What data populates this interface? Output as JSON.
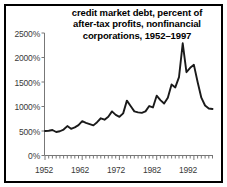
{
  "chart_data": {
    "type": "line",
    "title": "credit market debt, percent of after-tax profits, nonfinancial corporations, 1952–1997",
    "title_lines": [
      "credit market debt, percent of",
      "after-tax profits, nonfinancial",
      "corporations, 1952–1997"
    ],
    "xlabel": "",
    "ylabel": "",
    "xlim": [
      1952,
      1997
    ],
    "ylim": [
      0,
      2500
    ],
    "grid": false,
    "legend": null,
    "line_color": "#1a1a1a",
    "background_color": "#ffffff",
    "axis_color": "#555555",
    "border_color": "#000000",
    "ytick_labels": [
      "0%",
      "500%",
      "1000%",
      "1500%",
      "2000%",
      "2500%"
    ],
    "ytick_values": [
      0,
      500,
      1000,
      1500,
      2000,
      2500
    ],
    "xtick_labels": [
      "1952",
      "1962",
      "1972",
      "1982",
      "1992"
    ],
    "xtick_values": [
      1952,
      1962,
      1972,
      1982,
      1992
    ],
    "x": [
      1952,
      1953,
      1954,
      1955,
      1956,
      1957,
      1958,
      1959,
      1960,
      1961,
      1962,
      1963,
      1964,
      1965,
      1966,
      1967,
      1968,
      1969,
      1970,
      1971,
      1972,
      1973,
      1974,
      1975,
      1976,
      1977,
      1978,
      1979,
      1980,
      1981,
      1982,
      1983,
      1984,
      1985,
      1986,
      1987,
      1988,
      1989,
      1990,
      1991,
      1992,
      1993,
      1994,
      1995,
      1996,
      1997
    ],
    "values": [
      500,
      505,
      520,
      480,
      495,
      530,
      600,
      545,
      575,
      620,
      700,
      665,
      640,
      615,
      680,
      760,
      730,
      790,
      900,
      830,
      790,
      860,
      1120,
      1010,
      900,
      880,
      870,
      900,
      1010,
      980,
      1220,
      1130,
      1060,
      1180,
      1450,
      1390,
      1600,
      2290,
      1700,
      1790,
      1850,
      1500,
      1180,
      1020,
      960,
      950
    ],
    "series_name": "credit market debt as percent of after-tax profits",
    "annotations": []
  }
}
